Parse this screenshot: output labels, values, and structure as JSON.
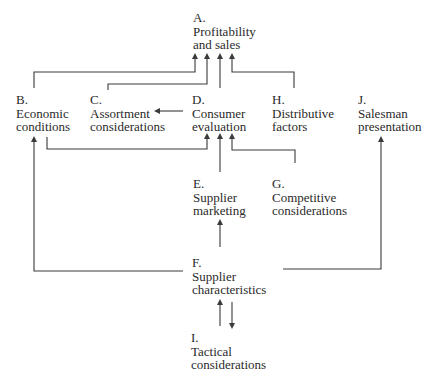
{
  "nodes": {
    "A": {
      "letter": "A.",
      "line1": "Profitability",
      "line2": "and sales"
    },
    "B": {
      "letter": "B.",
      "line1": "Economic",
      "line2": "conditions"
    },
    "C": {
      "letter": "C.",
      "line1": "Assortment",
      "line2": "considerations"
    },
    "D": {
      "letter": "D.",
      "line1": "Consumer",
      "line2": "evaluation"
    },
    "H": {
      "letter": "H.",
      "line1": "Distributive",
      "line2": "factors"
    },
    "J": {
      "letter": "J.",
      "line1": "Salesman",
      "line2": "presentation"
    },
    "E": {
      "letter": "E.",
      "line1": "Supplier",
      "line2": "marketing"
    },
    "G": {
      "letter": "G.",
      "line1": "Competitive",
      "line2": "considerations"
    },
    "F": {
      "letter": "F.",
      "line1": "Supplier",
      "line2": "characteristics"
    },
    "I": {
      "letter": "I.",
      "line1": "Tactical",
      "line2": "considerations"
    }
  },
  "edges": [
    {
      "from": "B",
      "to": "A"
    },
    {
      "from": "C",
      "to": "A"
    },
    {
      "from": "D",
      "to": "A"
    },
    {
      "from": "H",
      "to": "A"
    },
    {
      "from": "D",
      "to": "C"
    },
    {
      "from": "B",
      "to": "D"
    },
    {
      "from": "E",
      "to": "D"
    },
    {
      "from": "G",
      "to": "D"
    },
    {
      "from": "F",
      "to": "E"
    },
    {
      "from": "F",
      "to": "B"
    },
    {
      "from": "F",
      "to": "J"
    },
    {
      "from": "I",
      "to": "F"
    },
    {
      "from": "F",
      "to": "I"
    }
  ]
}
